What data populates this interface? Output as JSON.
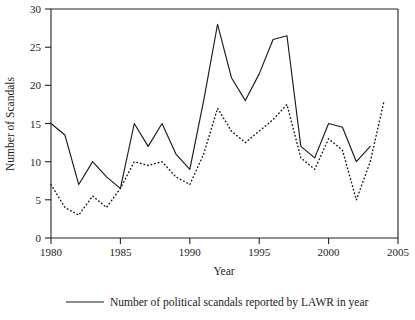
{
  "chart_data": {
    "type": "line",
    "title": "",
    "xlabel": "Year",
    "ylabel": "Number of Scandals",
    "xlim": [
      1980,
      2005
    ],
    "ylim": [
      0,
      30
    ],
    "xticks": [
      1980,
      1985,
      1990,
      1995,
      2000,
      2005
    ],
    "yticks": [
      0,
      5,
      10,
      15,
      20,
      25,
      30
    ],
    "grid": false,
    "legend_position": "bottom",
    "x": [
      1980,
      1981,
      1982,
      1983,
      1984,
      1985,
      1986,
      1987,
      1988,
      1989,
      1990,
      1991,
      1992,
      1993,
      1994,
      1995,
      1996,
      1997,
      1998,
      1999,
      2000,
      2001,
      2002,
      2003,
      2004
    ],
    "series": [
      {
        "name": "Number of political scandals reported by LAWR in year",
        "style": "solid",
        "values": [
          15,
          13.5,
          7,
          10,
          8,
          6.5,
          15,
          12,
          15,
          11,
          9,
          18,
          28,
          21,
          18,
          21.5,
          26,
          26.5,
          12,
          10.5,
          15,
          14.5,
          10,
          12,
          null
        ]
      },
      {
        "name": "dotted-series",
        "style": "dotted",
        "values": [
          7,
          4,
          3,
          5.5,
          4,
          6.5,
          10,
          9.5,
          10,
          8,
          7,
          11,
          17,
          14,
          12.5,
          14,
          15.5,
          17.5,
          10.5,
          9,
          13,
          11.5,
          5,
          10,
          18
        ]
      }
    ]
  },
  "axis": {
    "y_label": "Number of Scandals",
    "x_label": "Year",
    "y_ticks": [
      "0",
      "5",
      "10",
      "15",
      "20",
      "25",
      "30"
    ],
    "x_ticks": [
      "1980",
      "1985",
      "1990",
      "1995",
      "2000",
      "2005"
    ]
  },
  "legend": {
    "entries": [
      {
        "label": "Number of political scandals reported by LAWR in year",
        "style": "solid"
      }
    ]
  },
  "colors": {
    "ink": "#1a1a1a",
    "background": "#ffffff"
  }
}
